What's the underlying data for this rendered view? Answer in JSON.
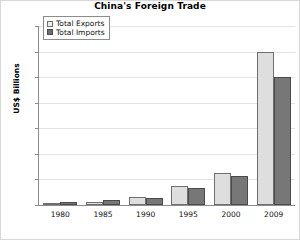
{
  "chart_data": {
    "type": "bar",
    "title": "China's Foreign Trade",
    "xlabel": "",
    "ylabel": "US$ Billions",
    "categories": [
      "1980",
      "1985",
      "1990",
      "1995",
      "2000",
      "2009"
    ],
    "series": [
      {
        "name": "Total Exports",
        "color": "#dedede",
        "values": [
          18,
          27,
          62,
          149,
          249,
          1200
        ]
      },
      {
        "name": "Total Imports",
        "color": "#777777",
        "values": [
          20,
          42,
          53,
          132,
          225,
          1000
        ]
      }
    ],
    "ylim": [
      0,
      1400
    ],
    "yticks": [
      0,
      200,
      400,
      600,
      800,
      1000,
      1200,
      1400
    ],
    "ytick_labels": [
      "0",
      "200",
      "400",
      "600",
      "800",
      "1000",
      "1200",
      "1400"
    ],
    "grid": true,
    "legend_position": "top-left",
    "legend_entries": [
      "Total Exports",
      "Total Imports"
    ]
  }
}
